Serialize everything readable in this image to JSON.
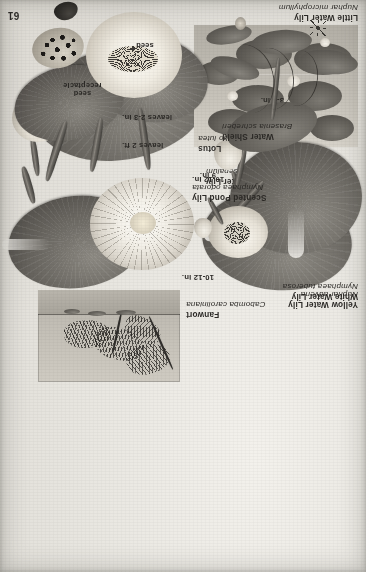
{
  "page": {
    "number": "61",
    "orientation": "upside-down",
    "kind": "botanical-plate",
    "paper_color": "#e8e6e1",
    "ink_color": "#2b2926"
  },
  "species": [
    {
      "id": "western-water-lily",
      "common": "Western Water Lily",
      "latin": "Nuphar polysepalum",
      "dimension": "10-12 in."
    },
    {
      "id": "little-water-lily",
      "common": "Little Water Lily",
      "latin": "Nuphar microphyllum",
      "dimension": "3-4 in."
    },
    {
      "id": "white-water-lily",
      "common": "White Water Lily",
      "latin": "Nymphaea tuberosa",
      "dimension": "10-12 in."
    },
    {
      "id": "fanwort",
      "common": "Fanwort",
      "latin": "Cabomba caroliniana",
      "dimension": ""
    },
    {
      "id": "yellow-water-lily",
      "common": "Yellow Water Lily",
      "latin": "Nuphar advena",
      "dimension": "9 in."
    },
    {
      "id": "scented-pond-lily",
      "common": "Scented Pond Lily",
      "latin": "Nymphaea odorata",
      "dimension": "10-12 in."
    },
    {
      "id": "lotus",
      "common": "Lotus",
      "latin": "Nelumbo lutea",
      "dimension": "leaves 2 ft."
    },
    {
      "id": "water-shield",
      "common": "Water Shield",
      "latin": "Brasenia schreberi",
      "dimension": "leaves 2-3 in."
    }
  ],
  "callouts": {
    "seed": "seed",
    "seed_receptacle_line1": "seed",
    "seed_receptacle_line2": "receptacle"
  }
}
